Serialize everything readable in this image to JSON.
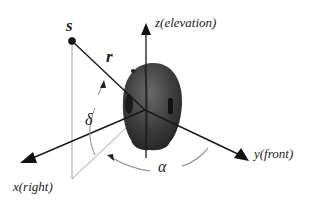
{
  "diagram": {
    "source_label": "s",
    "radius_label": "r",
    "elevation_angle_label": "δ",
    "azimuth_angle_label": "α",
    "axes": {
      "z": "z(elevation)",
      "x": "x(right)",
      "y": "y(front)"
    },
    "colors": {
      "axis": "#1a1a1a",
      "projection": "#9a9a9a",
      "angle_arc": "#8a8a8a",
      "head": "#3a3a3a"
    }
  }
}
